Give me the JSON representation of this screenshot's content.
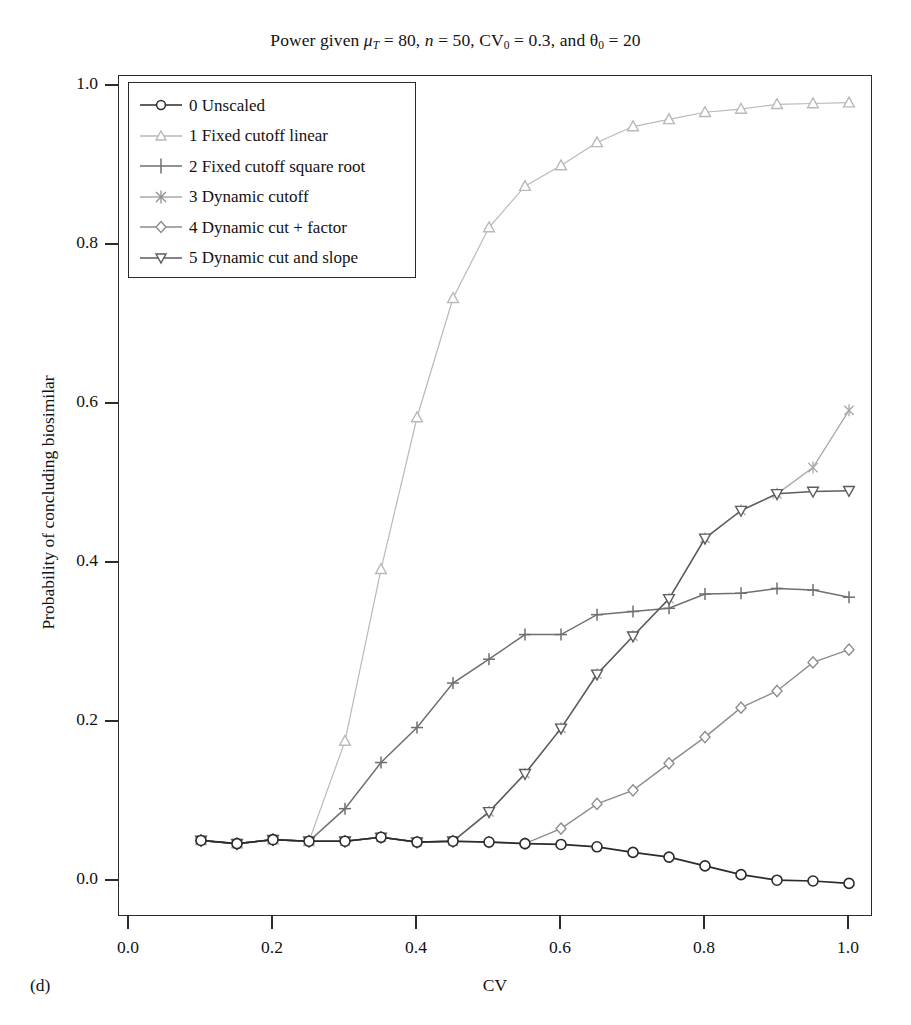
{
  "figure": {
    "panel_tag": "(d)",
    "title_prefix": "Power given ",
    "title_mu": "μ",
    "title_mu_sub": "T",
    "title_mu_val": " = 80, ",
    "title_n": "n",
    "title_n_val": " = 50, CV",
    "title_cv_sub": "0",
    "title_cv_val": " = 0.3, and ",
    "title_theta": "θ",
    "title_theta_sub": "0",
    "title_theta_val": " = 20",
    "title_plain": "Power given μT = 80, n = 50, CV0 = 0.3, and θ0 = 20"
  },
  "chart_data": {
    "type": "line",
    "title": "Power given μT = 80, n = 50, CV0 = 0.3, and θ0 = 20",
    "xlabel": "CV",
    "ylabel": "Probability of concluding biosimilar",
    "xlim": [
      0.0,
      1.0
    ],
    "ylim": [
      0.0,
      1.0
    ],
    "xticks": [
      0.0,
      0.2,
      0.4,
      0.6,
      0.8,
      1.0
    ],
    "xtick_labels": [
      "0.0",
      "0.2",
      "0.4",
      "0.6",
      "0.8",
      "1.0"
    ],
    "yticks": [
      0.0,
      0.2,
      0.4,
      0.6,
      0.8,
      1.0
    ],
    "ytick_labels": [
      "0.0",
      "0.2",
      "0.4",
      "0.6",
      "0.8",
      "1.0"
    ],
    "grid": false,
    "legend_position": "top-left",
    "x": [
      0.1,
      0.15,
      0.2,
      0.25,
      0.3,
      0.35,
      0.4,
      0.45,
      0.5,
      0.55,
      0.6,
      0.65,
      0.7,
      0.75,
      0.8,
      0.85,
      0.9,
      0.95,
      1.0
    ],
    "series": [
      {
        "name": "0 Unscaled",
        "marker": "circle",
        "color": "#2b2b2b",
        "values": [
          0.051,
          0.047,
          0.052,
          0.05,
          0.05,
          0.055,
          0.049,
          0.05,
          0.049,
          0.047,
          0.046,
          0.043,
          0.036,
          0.03,
          0.019,
          0.008,
          0.001,
          0.0,
          -0.003
        ]
      },
      {
        "name": "1 Fixed cutoff linear",
        "marker": "triangle-up",
        "color": "#b9b9b9",
        "values": [
          0.051,
          0.047,
          0.052,
          0.05,
          0.176,
          0.392,
          0.583,
          0.733,
          0.822,
          0.874,
          0.9,
          0.929,
          0.949,
          0.958,
          0.967,
          0.971,
          0.977,
          0.978,
          0.979
        ]
      },
      {
        "name": "2 Fixed cutoff square root",
        "marker": "plus",
        "color": "#6f6f6f",
        "values": [
          0.051,
          0.047,
          0.052,
          0.05,
          0.091,
          0.149,
          0.193,
          0.249,
          0.279,
          0.31,
          0.31,
          0.335,
          0.339,
          0.343,
          0.361,
          0.362,
          0.368,
          0.366,
          0.357
        ]
      },
      {
        "name": "3 Dynamic cutoff",
        "marker": "asterisk",
        "color": "#a8a8a8",
        "values": [
          0.051,
          0.047,
          0.052,
          0.05,
          0.05,
          0.055,
          0.049,
          0.05,
          0.049,
          0.047,
          0.046,
          0.043,
          0.036,
          0.03,
          0.019,
          0.008,
          0.001,
          0.0,
          -0.003
        ]
      },
      {
        "name": "4 Dynamic cut + factor",
        "marker": "diamond",
        "color": "#8d8d8d",
        "values": [
          0.051,
          0.047,
          0.052,
          0.05,
          0.05,
          0.055,
          0.049,
          0.05,
          0.049,
          0.047,
          0.066,
          0.097,
          0.114,
          0.148,
          0.181,
          0.218,
          0.239,
          0.275,
          0.291
        ]
      },
      {
        "name": "5 Dynamic cut and slope",
        "marker": "triangle-down",
        "color": "#5d5d5d",
        "values": [
          0.051,
          0.047,
          0.052,
          0.05,
          0.05,
          0.055,
          0.049,
          0.05,
          0.087,
          0.135,
          0.192,
          0.26,
          0.308,
          0.355,
          0.431,
          0.466,
          0.487,
          0.49,
          0.491
        ]
      }
    ],
    "series_overlay_note": "series 3 (Dynamic cutoff) rises: see values_3_upper",
    "series_3_upper": {
      "name": "3 Dynamic cutoff",
      "values": [
        0.051,
        0.047,
        0.052,
        0.05,
        0.05,
        0.055,
        0.049,
        0.05,
        0.049,
        0.047,
        0.046,
        0.043,
        0.036,
        0.03,
        0.019,
        0.008,
        0.001,
        0.0,
        -0.003
      ]
    }
  },
  "legend": {
    "items": [
      {
        "label": "0 Unscaled"
      },
      {
        "label": "1 Fixed cutoff linear"
      },
      {
        "label": "2 Fixed cutoff square root"
      },
      {
        "label": "3 Dynamic cutoff"
      },
      {
        "label": "4 Dynamic cut + factor"
      },
      {
        "label": "5 Dynamic cut and slope"
      }
    ]
  }
}
